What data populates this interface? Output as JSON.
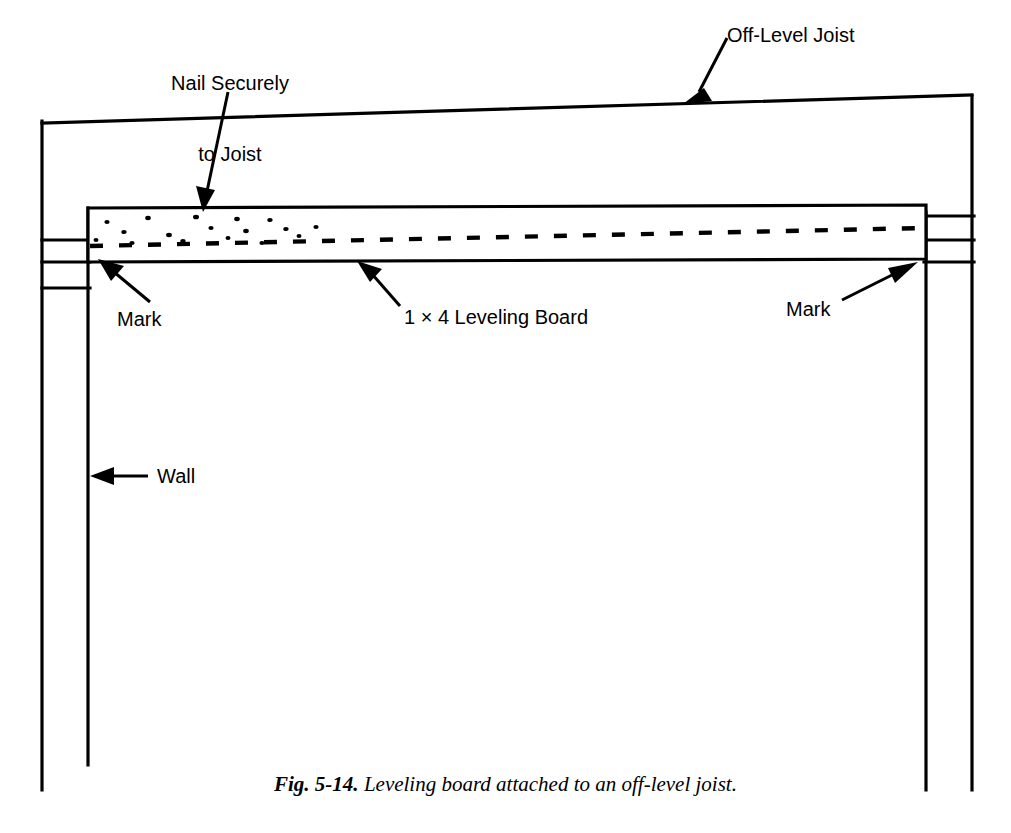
{
  "figure": {
    "caption_number": "Fig. 5-14.",
    "caption_text": " Leveling board attached to an off-level joist.",
    "ink_color": "#000000",
    "background_color": "#ffffff"
  },
  "labels": {
    "nail_line1": "Nail Securely",
    "nail_line2": "to Joist",
    "off_level_joist": "Off-Level Joist",
    "leveling_board": "1 × 4 Leveling Board",
    "mark_left": "Mark",
    "mark_right": "Mark",
    "wall": "Wall"
  },
  "diagram": {
    "type": "line-drawing",
    "parts": [
      "off-level joist",
      "1 x 4 leveling board",
      "left wall",
      "right wall",
      "mark at left board corner",
      "mark at right board corner"
    ]
  }
}
